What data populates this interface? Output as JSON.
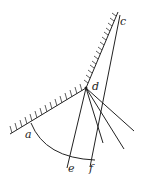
{
  "diagram": {
    "type": "geometric-optics",
    "labels": {
      "a": "a",
      "c": "c",
      "d": "d",
      "e": "e",
      "f": "f"
    },
    "points": {
      "a": [
        30,
        124
      ],
      "c": [
        119,
        16
      ],
      "d": [
        86,
        88
      ],
      "e": [
        68,
        162
      ],
      "f": [
        91,
        160
      ]
    },
    "colors": {
      "line": "#222222",
      "background": "#ffffff"
    }
  }
}
